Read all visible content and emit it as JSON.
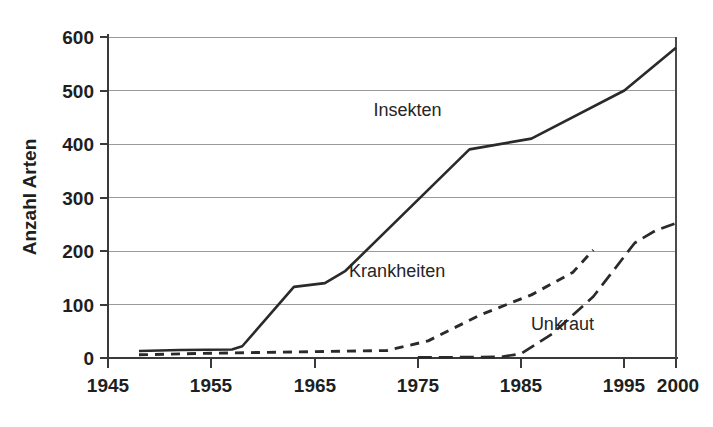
{
  "chart_data": {
    "type": "line",
    "title": "",
    "subtitle": "",
    "xlabel": "",
    "ylabel": "Anzahl Arten",
    "xlim": [
      1945,
      2000
    ],
    "ylim": [
      0,
      600
    ],
    "grid": true,
    "legend_position": "inline-annotations",
    "x_ticks": [
      1945,
      1955,
      1965,
      1975,
      1985,
      1995,
      2000
    ],
    "x_tick_labels": [
      "1945",
      "1955",
      "1965",
      "1975",
      "1985",
      "1995",
      "2000"
    ],
    "y_ticks": [
      0,
      100,
      200,
      300,
      400,
      500,
      600
    ],
    "y_tick_labels": [
      "0",
      "100",
      "200",
      "300",
      "400",
      "500",
      "600"
    ],
    "series": [
      {
        "name": "Insekten",
        "style": "solid",
        "label_x": 1974,
        "label_y": 452,
        "points": [
          [
            1948,
            13
          ],
          [
            1952,
            15
          ],
          [
            1957,
            16
          ],
          [
            1958,
            22
          ],
          [
            1963,
            133
          ],
          [
            1966,
            140
          ],
          [
            1968,
            163
          ],
          [
            1980,
            390
          ],
          [
            1986,
            410
          ],
          [
            1995,
            500
          ],
          [
            2000,
            580
          ]
        ]
      },
      {
        "name": "Krankheiten",
        "style": "dashed",
        "label_x": 1973,
        "label_y": 152,
        "points": [
          [
            1948,
            6
          ],
          [
            1955,
            9
          ],
          [
            1962,
            11
          ],
          [
            1972,
            14
          ],
          [
            1976,
            32
          ],
          [
            1981,
            80
          ],
          [
            1984,
            103
          ],
          [
            1986,
            118
          ],
          [
            1990,
            160
          ],
          [
            1992,
            202
          ]
        ]
      },
      {
        "name": "Unkraut",
        "style": "dash-dot",
        "label_x": 1989,
        "label_y": 52,
        "points": [
          [
            1975,
            1
          ],
          [
            1983,
            2
          ],
          [
            1985,
            8
          ],
          [
            1988,
            45
          ],
          [
            1992,
            115
          ],
          [
            1996,
            215
          ],
          [
            1998,
            238
          ],
          [
            2000,
            252
          ]
        ]
      }
    ]
  },
  "axes": {
    "y_axis_title": "Anzahl Arten"
  }
}
